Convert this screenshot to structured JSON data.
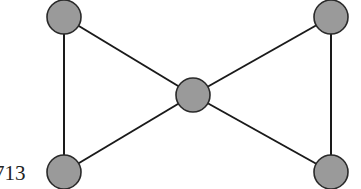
{
  "diagram": {
    "type": "graph",
    "node_fill": "#9a9a9a",
    "node_stroke": "#2a2a2a",
    "edge_color": "#1a1a1a",
    "nodes": [
      {
        "id": "top-left",
        "x": 64,
        "y": 17,
        "r": 17
      },
      {
        "id": "top-right",
        "x": 331,
        "y": 17,
        "r": 17
      },
      {
        "id": "center",
        "x": 193,
        "y": 95,
        "r": 17
      },
      {
        "id": "bottom-left",
        "x": 64,
        "y": 172,
        "r": 17
      },
      {
        "id": "bottom-right",
        "x": 331,
        "y": 172,
        "r": 17
      }
    ],
    "edges": [
      {
        "from": "top-left",
        "to": "bottom-left"
      },
      {
        "from": "top-left",
        "to": "center"
      },
      {
        "from": "bottom-left",
        "to": "center"
      },
      {
        "from": "top-right",
        "to": "bottom-right"
      },
      {
        "from": "top-right",
        "to": "center"
      },
      {
        "from": "bottom-right",
        "to": "center"
      }
    ]
  },
  "caption": {
    "text": "713"
  }
}
